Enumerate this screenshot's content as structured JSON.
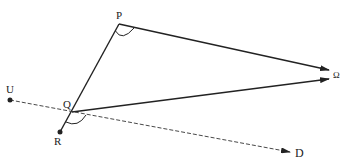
{
  "diagram": {
    "points": {
      "P": {
        "label": "P",
        "x": 119,
        "y": 24
      },
      "Q": {
        "label": "Q",
        "x": 72,
        "y": 112
      },
      "R": {
        "label": "R",
        "x": 60,
        "y": 132
      },
      "U": {
        "label": "U",
        "x": 10,
        "y": 100
      },
      "Omega": {
        "label": "Ω",
        "x": 330,
        "y": 75
      },
      "D": {
        "label": "D",
        "x": 292,
        "y": 152
      }
    },
    "labels": {
      "P": "P",
      "Q": "Q",
      "R": "R",
      "U": "U",
      "Omega": "Ω",
      "D": "D"
    },
    "segments": [
      {
        "from": "R",
        "to": "P",
        "style": "solid"
      },
      {
        "from": "P",
        "to": "Omega",
        "style": "solid-arrow"
      },
      {
        "from": "Q",
        "to": "Omega",
        "style": "solid-arrow"
      },
      {
        "from": "U",
        "to": "D",
        "style": "dashed-arrow"
      }
    ],
    "angle_marks": [
      "angle-at-P",
      "angle-at-Q"
    ],
    "colors": {
      "stroke": "#222222",
      "background": "#ffffff"
    }
  }
}
